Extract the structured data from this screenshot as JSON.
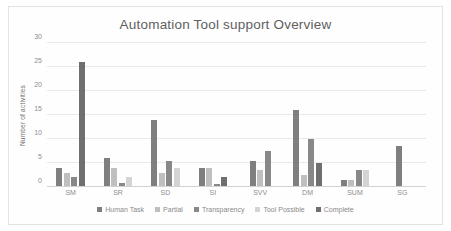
{
  "chart_data": {
    "type": "bar",
    "title": "Automation Tool support Overview",
    "xlabel": "",
    "ylabel": "Number of activities",
    "ylim": [
      0,
      30
    ],
    "yticks": [
      0,
      5,
      10,
      15,
      20,
      25,
      30
    ],
    "grid": true,
    "legend_position": "bottom",
    "categories": [
      "SM",
      "SR",
      "SD",
      "SI",
      "SVV",
      "DM",
      "SUM",
      "SG"
    ],
    "series": [
      {
        "name": "Human Task",
        "color": "#7f7f7f",
        "values": [
          4,
          6,
          14,
          4,
          5.5,
          16,
          1.5,
          8.5
        ]
      },
      {
        "name": "Partial",
        "color": "#bfbfbf",
        "values": [
          3,
          4,
          3,
          4,
          3.5,
          2.5,
          1.5,
          0.3
        ]
      },
      {
        "name": "Transparency",
        "color": "#888888",
        "values": [
          2,
          0.8,
          5.5,
          0.6,
          7.5,
          10,
          3.5,
          0
        ]
      },
      {
        "name": "Tool Possible",
        "color": "#d4d4d4",
        "values": [
          0,
          2,
          4,
          0,
          0,
          0,
          3.5,
          0
        ]
      },
      {
        "name": "Complete",
        "color": "#6f6f6f",
        "values": [
          26,
          0,
          0,
          2,
          0,
          5,
          0,
          0
        ]
      }
    ]
  },
  "legend": {
    "items": [
      {
        "label": "Human Task",
        "color": "#7f7f7f"
      },
      {
        "label": "Partial",
        "color": "#bfbfbf"
      },
      {
        "label": "Transparency",
        "color": "#888888"
      },
      {
        "label": "Tool Possible",
        "color": "#d4d4d4"
      },
      {
        "label": "Complete",
        "color": "#6f6f6f"
      }
    ]
  }
}
